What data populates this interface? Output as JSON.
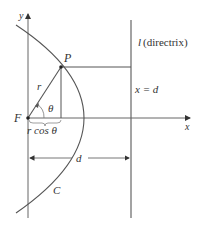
{
  "diagram": {
    "type": "conic-section-directrix",
    "labels": {
      "y_axis": "y",
      "x_axis": "x",
      "focus": "F",
      "point": "P",
      "radius": "r",
      "angle": "θ",
      "horizontal_component": "r cos θ",
      "distance": "d",
      "curve": "C",
      "directrix_letter": "l",
      "directrix_text": "(directrix)",
      "directrix_equation": "x = d"
    },
    "colors": {
      "line": "#555555",
      "text": "#333333",
      "background": "#ffffff"
    }
  }
}
